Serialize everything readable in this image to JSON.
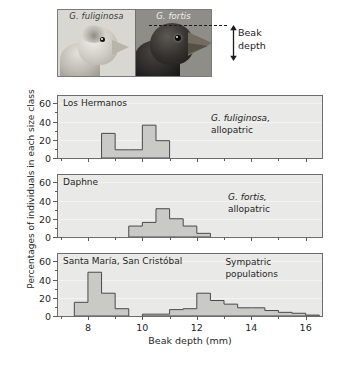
{
  "figure": {
    "photo": {
      "left_label": "G. fuliginosa",
      "right_label": "G. fortis",
      "annotation_line1": "Beak",
      "annotation_line2": "depth"
    },
    "ylabel": "Percentages of individuals in each size class",
    "xlabel": "Beak depth (mm)"
  },
  "chart_data": {
    "type": "bar",
    "xlabel": "Beak depth (mm)",
    "ylabel": "Percentages of individuals in each size class",
    "xlim": [
      6.9,
      16.6
    ],
    "ylim": [
      0,
      68
    ],
    "yticks": [
      0,
      20,
      40,
      60
    ],
    "ytick_minor": [
      10,
      30,
      50
    ],
    "xticks": [
      8,
      10,
      12,
      14,
      16
    ],
    "xtick_minor": [
      7,
      9,
      11,
      13,
      15,
      16
    ],
    "grid": true,
    "legend": "none",
    "bin_width": 0.5,
    "bar_color": "#c9c9c5",
    "bar_edge_color": "#4a4a4a",
    "panels": [
      {
        "title": "Los Hermanos",
        "annotation_species": "G. fuliginosa,",
        "annotation_mode": "allopatric",
        "bins": [
          8.5,
          9.0,
          9.5,
          10.0,
          10.5
        ],
        "values": [
          27,
          9,
          9,
          36,
          19
        ]
      },
      {
        "title": "Daphne",
        "annotation_species": "G. fortis,",
        "annotation_mode": "allopatric",
        "bins": [
          9.5,
          10.0,
          10.5,
          11.0,
          11.5,
          12.0
        ],
        "values": [
          12,
          16,
          31,
          20,
          12,
          4
        ]
      },
      {
        "title": "Santa María, San Cristóbal",
        "annotation_species": "Sympatric",
        "annotation_mode": "populations",
        "bins": [
          7.5,
          8.0,
          8.5,
          9.0,
          10.0,
          10.5,
          11.0,
          11.5,
          12.0,
          12.5,
          13.0,
          13.5,
          14.0,
          14.5,
          15.0,
          15.5,
          16.0
        ],
        "values": [
          15,
          48,
          25,
          8,
          2,
          2,
          7,
          8,
          25,
          17,
          13,
          9,
          9,
          6,
          4,
          3,
          1
        ]
      }
    ]
  }
}
